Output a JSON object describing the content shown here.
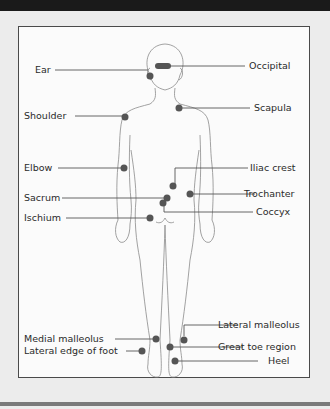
{
  "figure": {
    "type": "anatomical pressure-point diagram, posterior view",
    "marker_color": "#555555",
    "labels_left": [
      {
        "id": "ear",
        "text": "Ear"
      },
      {
        "id": "shoulder",
        "text": "Shoulder"
      },
      {
        "id": "elbow",
        "text": "Elbow"
      },
      {
        "id": "sacrum",
        "text": "Sacrum"
      },
      {
        "id": "ischium",
        "text": "Ischium"
      },
      {
        "id": "medial-malleolus",
        "text": "Medial malleolus"
      },
      {
        "id": "lateral-edge-of-foot",
        "text": "Lateral edge of foot"
      }
    ],
    "labels_right": [
      {
        "id": "occipital",
        "text": "Occipital"
      },
      {
        "id": "scapula",
        "text": "Scapula"
      },
      {
        "id": "iliac-crest",
        "text": "Iliac crest"
      },
      {
        "id": "trochanter",
        "text": "Trochanter"
      },
      {
        "id": "coccyx",
        "text": "Coccyx"
      },
      {
        "id": "lateral-malleolus",
        "text": "Lateral malleolus"
      },
      {
        "id": "great-toe-region",
        "text": "Great toe region"
      },
      {
        "id": "heel",
        "text": "Heel"
      }
    ]
  }
}
